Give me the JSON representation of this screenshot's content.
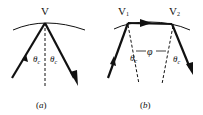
{
  "panels": [
    {
      "id": "a",
      "caption": "(a)",
      "vertex_label": "V",
      "angle_labels": [
        "θ",
        "θ"
      ],
      "angle_subscript": "c"
    },
    {
      "id": "b",
      "caption": "(b)",
      "vertex_labels": [
        "V",
        "V"
      ],
      "vertex_subscripts": [
        "1",
        "2"
      ],
      "angle_labels": [
        "θ",
        "θ"
      ],
      "angle_subscript": "c",
      "separation_label": "φ"
    }
  ],
  "colors": {
    "stroke": "#111111",
    "background": "#ffffff"
  }
}
